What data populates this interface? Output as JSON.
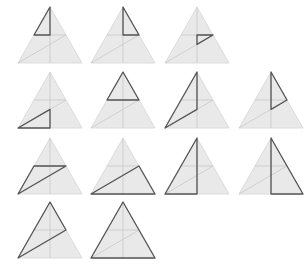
{
  "figure": {
    "colors": {
      "fill": "#e9e9e9",
      "guide": "#c4c4c4",
      "highlight": "#555555",
      "background": "#ffffff"
    },
    "triangle_size": {
      "width": 64,
      "height": 56
    },
    "points_legend": {
      "A": [
        0.5,
        0
      ],
      "L": [
        0,
        1
      ],
      "R": [
        1,
        1
      ],
      "M": [
        0.5,
        1
      ],
      "Lm": [
        0.25,
        0.5
      ],
      "Rm": [
        0.75,
        0.5
      ],
      "C": [
        0.5,
        0.5
      ],
      "D": [
        0.5,
        0.6667
      ]
    },
    "panels": [
      {
        "row": 1,
        "cx": 50,
        "top": 7,
        "highlight": [
          "A",
          "Lm",
          "C"
        ]
      },
      {
        "row": 1,
        "cx": 123,
        "top": 7,
        "highlight": [
          "A",
          "C",
          "Rm"
        ]
      },
      {
        "row": 1,
        "cx": 197,
        "top": 7,
        "highlight": [
          "C",
          "Rm",
          "D"
        ]
      },
      {
        "row": 2,
        "cx": 50,
        "top": 72,
        "highlight": [
          "L",
          "D",
          "M"
        ]
      },
      {
        "row": 2,
        "cx": 123,
        "top": 72,
        "highlight": [
          "A",
          "Lm",
          "Rm"
        ]
      },
      {
        "row": 2,
        "cx": 197,
        "top": 72,
        "highlight": [
          "A",
          "L",
          "D"
        ]
      },
      {
        "row": 2,
        "cx": 271,
        "top": 72,
        "highlight": [
          "A",
          "Rm",
          "D"
        ]
      },
      {
        "row": 3,
        "cx": 50,
        "top": 138,
        "highlight": [
          "Lm",
          "Rm",
          "L"
        ]
      },
      {
        "row": 3,
        "cx": 123,
        "top": 138,
        "highlight": [
          "L",
          "Rm",
          "R"
        ]
      },
      {
        "row": 3,
        "cx": 197,
        "top": 138,
        "highlight": [
          "A",
          "L",
          "M"
        ]
      },
      {
        "row": 3,
        "cx": 271,
        "top": 138,
        "highlight": [
          "A",
          "M",
          "R"
        ]
      },
      {
        "row": 4,
        "cx": 50,
        "top": 202,
        "highlight": [
          "A",
          "L",
          "Rm"
        ]
      },
      {
        "row": 4,
        "cx": 123,
        "top": 202,
        "highlight": [
          "A",
          "L",
          "R"
        ]
      }
    ]
  }
}
